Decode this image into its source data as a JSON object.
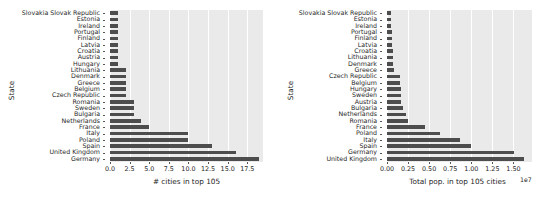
{
  "figure": {
    "background": "#ffffff",
    "plot_background": "#eaeaea",
    "bar_color": "#4d4d4d",
    "grid_color": "#ffffff"
  },
  "chart_data": [
    {
      "type": "bar",
      "orientation": "horizontal",
      "title": "",
      "xlabel": "# cities in top 105",
      "ylabel": "State",
      "xlim": [
        0,
        19.5
      ],
      "grid": true,
      "legend": null,
      "xticks": [
        "0.0",
        "2.5",
        "5.0",
        "7.5",
        "10.0",
        "12.5",
        "15.0",
        "17.5"
      ],
      "xtick_values": [
        0.0,
        2.5,
        5.0,
        7.5,
        10.0,
        12.5,
        15.0,
        17.5
      ],
      "categories": [
        "Slovakia Slovak Republic",
        "Estonia",
        "Ireland",
        "Portugal",
        "Finland",
        "Latvia",
        "Croatia",
        "Austria",
        "Hungary",
        "Lithuania",
        "Denmark",
        "Greece",
        "Belgium",
        "Czech Republic",
        "Romania",
        "Sweden",
        "Bulgaria",
        "Netherlands",
        "France",
        "Italy",
        "Poland",
        "Spain",
        "United Kingdom",
        "Germany"
      ],
      "values": [
        1,
        1,
        1,
        1,
        1,
        1,
        1,
        1,
        1,
        2,
        2,
        2,
        2,
        2,
        3,
        3,
        3,
        4,
        5,
        10,
        10,
        13,
        16,
        19
      ]
    },
    {
      "type": "bar",
      "orientation": "horizontal",
      "title": "",
      "xlabel": "Total pop. in top 105 cities",
      "ylabel": "State",
      "exponent_label": "1e7",
      "xlim": [
        0,
        1.72
      ],
      "grid": true,
      "legend": null,
      "xticks": [
        "0.00",
        "0.25",
        "0.50",
        "0.75",
        "1.00",
        "1.25",
        "1.50"
      ],
      "xtick_values": [
        0.0,
        0.25,
        0.5,
        0.75,
        1.0,
        1.25,
        1.5
      ],
      "categories": [
        "Slovakia Slovak Republic",
        "Estonia",
        "Ireland",
        "Portugal",
        "Finland",
        "Latvia",
        "Croatia",
        "Lithuania",
        "Denmark",
        "Greece",
        "Czech Republic",
        "Belgium",
        "Hungary",
        "Sweden",
        "Austria",
        "Bulgaria",
        "Netherlands",
        "Romania",
        "France",
        "Poland",
        "Italy",
        "Spain",
        "Germany",
        "United Kingdom"
      ],
      "values": [
        0.042,
        0.044,
        0.052,
        0.055,
        0.062,
        0.065,
        0.07,
        0.073,
        0.076,
        0.082,
        0.152,
        0.155,
        0.162,
        0.165,
        0.168,
        0.185,
        0.225,
        0.245,
        0.445,
        0.625,
        0.87,
        1.0,
        1.51,
        1.62
      ]
    }
  ]
}
